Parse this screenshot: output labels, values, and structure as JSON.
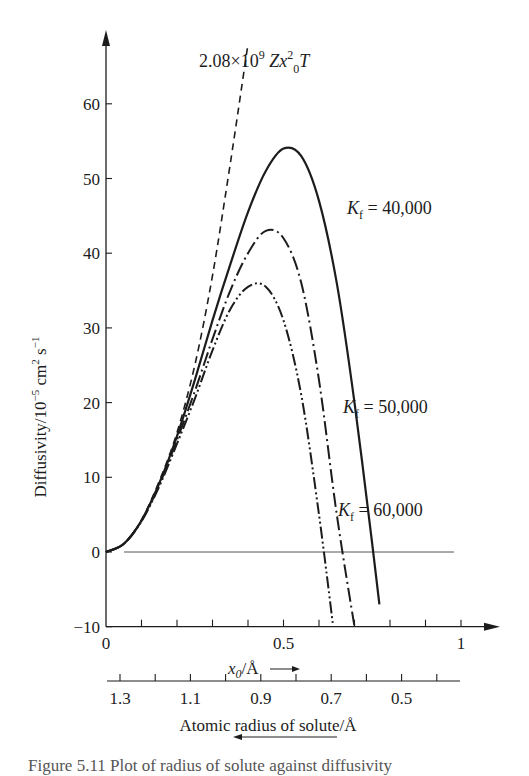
{
  "chart_data": {
    "type": "line",
    "title": "",
    "xlabel": "x0/Å",
    "x_arrow": "→",
    "ylabel": "Diffusivity/10^-5 cm^2 s^-1",
    "secondary_xlabel": "Atomic radius of solute/Å",
    "secondary_arrow": "←",
    "xlim": [
      0,
      1
    ],
    "ylim": [
      -10,
      68
    ],
    "x_ticks": [
      0,
      0.1,
      0.2,
      0.3,
      0.4,
      0.5,
      0.6,
      0.7,
      0.8,
      0.9,
      1.0
    ],
    "x_tick_labels": [
      {
        "v": 0,
        "t": "0"
      },
      {
        "v": 0.5,
        "t": "0.5"
      },
      {
        "v": 1.0,
        "t": "1"
      }
    ],
    "y_ticks": [
      -10,
      0,
      10,
      20,
      30,
      40,
      50,
      60
    ],
    "y_tick_labels": [
      "−10",
      "0",
      "10",
      "20",
      "30",
      "40",
      "50",
      "60"
    ],
    "secondary_ticks": [
      1.3,
      1.2,
      1.1,
      1.0,
      0.9,
      0.8,
      0.7,
      0.6,
      0.5,
      0.4
    ],
    "secondary_tick_labels": [
      "1.3",
      "1.1",
      "0.9",
      "0.7",
      "0.5"
    ],
    "grid": false,
    "series": [
      {
        "name": "2.08×10^9 Z x0^2 T",
        "style": "dashed",
        "x": [
          0,
          0.05,
          0.1,
          0.15,
          0.2,
          0.25,
          0.3,
          0.35,
          0.4
        ],
        "y": [
          0,
          1.1,
          4.3,
          9.5,
          16,
          25,
          37,
          52,
          68
        ]
      },
      {
        "name": "Kf = 40,000",
        "style": "solid",
        "x": [
          0,
          0.05,
          0.1,
          0.15,
          0.2,
          0.25,
          0.3,
          0.35,
          0.4,
          0.45,
          0.5,
          0.55,
          0.6,
          0.65,
          0.7,
          0.75,
          0.77
        ],
        "y": [
          0,
          1.1,
          4.2,
          9.2,
          15.5,
          23,
          31,
          38.5,
          45.5,
          51,
          54,
          53,
          47,
          36,
          20,
          1,
          -7
        ]
      },
      {
        "name": "Kf = 50,000",
        "style": "dash-dot",
        "x": [
          0,
          0.05,
          0.1,
          0.15,
          0.2,
          0.25,
          0.3,
          0.35,
          0.4,
          0.45,
          0.5,
          0.55,
          0.6,
          0.65,
          0.7
        ],
        "y": [
          0,
          1.1,
          4.2,
          9,
          15,
          21.5,
          28.5,
          35,
          40,
          43,
          42,
          36,
          23,
          5,
          -10
        ]
      },
      {
        "name": "Kf = 60,000",
        "style": "dash-dot-dot",
        "x": [
          0,
          0.05,
          0.1,
          0.15,
          0.2,
          0.25,
          0.3,
          0.35,
          0.4,
          0.45,
          0.5,
          0.55,
          0.6,
          0.64
        ],
        "y": [
          0,
          1.1,
          4.1,
          8.8,
          14.5,
          20.5,
          27,
          32.5,
          35.5,
          35.5,
          31,
          21,
          5,
          -10
        ]
      }
    ],
    "annotations": [
      {
        "text_main": "2.08×10",
        "sup": "9",
        "rest": " Zx",
        "sup2": "2",
        "sub2": "0",
        "tail": "T"
      },
      {
        "k": "K",
        "sub": "f",
        "eq": " = 40,000"
      },
      {
        "k": "K",
        "sub": "f",
        "eq": " = 50,000"
      },
      {
        "k": "K",
        "sub": "f",
        "eq": " = 60,000"
      }
    ]
  },
  "caption": "Figure 5.11  Plot of radius of solute against diffusivity"
}
